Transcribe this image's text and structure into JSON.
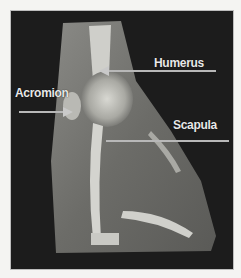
{
  "figure": {
    "labels": {
      "humerus": "Humerus",
      "acromion": "Acromion",
      "scapula": "Scapula"
    },
    "colors": {
      "background": "#1c1c1c",
      "label_text": "#e8e8e8",
      "pointer_line": "#b8b8b8"
    }
  }
}
